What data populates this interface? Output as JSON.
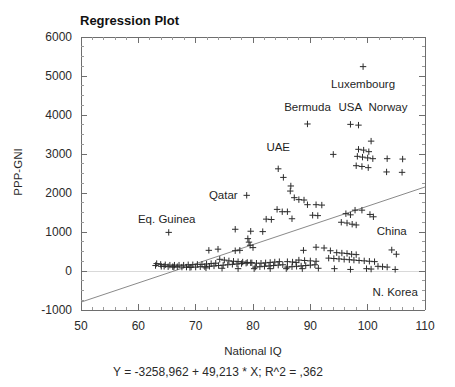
{
  "chart_data": {
    "type": "scatter",
    "title": "Regression Plot",
    "xlabel": "National IQ",
    "ylabel": "PPP-GNI",
    "xlim": [
      50,
      110
    ],
    "ylim": [
      -1000,
      6000
    ],
    "xticks": [
      50,
      60,
      70,
      80,
      90,
      100,
      110
    ],
    "yticks": [
      -1000,
      0,
      1000,
      2000,
      3000,
      4000,
      5000,
      6000
    ],
    "x_minor_step": 2,
    "y_minor_step": 250,
    "grid": false,
    "legend": "none",
    "equation_text": "Y = -3258,962 + 49,213 * X; R^2 = ,362",
    "regression": {
      "intercept": -3258.962,
      "slope": 49.213,
      "r_squared": 0.362,
      "line_from": [
        50,
        -798.3
      ],
      "line_to": [
        110,
        2154.5
      ]
    },
    "annotations": [
      {
        "label": "Luxembourg",
        "x": 99.2,
        "y": 5240,
        "anchor": "middle",
        "dx": 0,
        "dy": 21
      },
      {
        "label": "Bermuda",
        "x": 89.5,
        "y": 3880,
        "anchor": "middle",
        "dx": 0,
        "dy": -9
      },
      {
        "label": "USA",
        "x": 97.5,
        "y": 3870,
        "anchor": "middle",
        "dx": -3,
        "dy": -9
      },
      {
        "label": "Norway",
        "x": 103.2,
        "y": 3860,
        "anchor": "middle",
        "dx": 2,
        "dy": -9
      },
      {
        "label": "UAE",
        "x": 84.4,
        "y": 2850,
        "anchor": "middle",
        "dx": 0,
        "dy": -9
      },
      {
        "label": "Qatar",
        "x": 78.2,
        "y": 1960,
        "anchor": "end",
        "dx": -5,
        "dy": 4
      },
      {
        "label": "Eq. Guinea",
        "x": 65.3,
        "y": 990,
        "anchor": "middle",
        "dx": -2,
        "dy": -9
      },
      {
        "label": "China",
        "x": 104.2,
        "y": 690,
        "anchor": "middle",
        "dx": 0,
        "dy": -9
      },
      {
        "label": "N. Korea",
        "x": 104.8,
        "y": -220,
        "anchor": "middle",
        "dx": 0,
        "dy": 16
      }
    ],
    "points": [
      [
        99.2,
        5240
      ],
      [
        89.5,
        3770
      ],
      [
        97.0,
        3760
      ],
      [
        98.4,
        3740
      ],
      [
        100.6,
        3330
      ],
      [
        94.0,
        2990
      ],
      [
        98.4,
        3120
      ],
      [
        99.3,
        3100
      ],
      [
        100.2,
        3060
      ],
      [
        98.2,
        2940
      ],
      [
        99.1,
        2920
      ],
      [
        100.0,
        2900
      ],
      [
        100.9,
        2880
      ],
      [
        103.4,
        2880
      ],
      [
        106.1,
        2870
      ],
      [
        98.0,
        2700
      ],
      [
        99.0,
        2680
      ],
      [
        100.1,
        2650
      ],
      [
        103.3,
        2540
      ],
      [
        106.0,
        2530
      ],
      [
        84.4,
        2620
      ],
      [
        85.3,
        2400
      ],
      [
        86.6,
        2180
      ],
      [
        86.5,
        2050
      ],
      [
        87.2,
        1880
      ],
      [
        88.0,
        1830
      ],
      [
        88.9,
        1820
      ],
      [
        78.9,
        1940
      ],
      [
        89.5,
        1700
      ],
      [
        91.0,
        1700
      ],
      [
        92.0,
        1690
      ],
      [
        84.2,
        1580
      ],
      [
        85.1,
        1520
      ],
      [
        86.0,
        1520
      ],
      [
        82.3,
        1330
      ],
      [
        83.2,
        1320
      ],
      [
        86.8,
        1340
      ],
      [
        90.4,
        1430
      ],
      [
        91.3,
        1420
      ],
      [
        96.2,
        1470
      ],
      [
        97.0,
        1440
      ],
      [
        97.8,
        1560
      ],
      [
        99.0,
        1560
      ],
      [
        100.4,
        1450
      ],
      [
        101.0,
        1390
      ],
      [
        95.4,
        1250
      ],
      [
        96.4,
        1230
      ],
      [
        97.3,
        1200
      ],
      [
        98.0,
        1180
      ],
      [
        65.3,
        990
      ],
      [
        76.9,
        1070
      ],
      [
        79.6,
        1020
      ],
      [
        81.7,
        1010
      ],
      [
        79.1,
        830
      ],
      [
        79.3,
        740
      ],
      [
        79.5,
        660
      ],
      [
        80.0,
        600
      ],
      [
        72.3,
        530
      ],
      [
        73.9,
        560
      ],
      [
        76.9,
        520
      ],
      [
        77.7,
        530
      ],
      [
        88.8,
        530
      ],
      [
        91.0,
        610
      ],
      [
        92.4,
        590
      ],
      [
        93.5,
        520
      ],
      [
        94.6,
        470
      ],
      [
        95.5,
        460
      ],
      [
        96.4,
        450
      ],
      [
        97.2,
        430
      ],
      [
        98.0,
        420
      ],
      [
        93.2,
        330
      ],
      [
        94.1,
        320
      ],
      [
        95.0,
        310
      ],
      [
        95.9,
        300
      ],
      [
        96.8,
        290
      ],
      [
        97.6,
        280
      ],
      [
        98.5,
        270
      ],
      [
        99.4,
        260
      ],
      [
        100.3,
        250
      ],
      [
        101.2,
        240
      ],
      [
        88.0,
        280
      ],
      [
        89.0,
        270
      ],
      [
        90.0,
        260
      ],
      [
        91.0,
        250
      ],
      [
        86.0,
        240
      ],
      [
        86.9,
        230
      ],
      [
        87.5,
        220
      ],
      [
        74.2,
        300
      ],
      [
        75.0,
        280
      ],
      [
        75.8,
        260
      ],
      [
        76.6,
        250
      ],
      [
        77.4,
        240
      ],
      [
        78.2,
        230
      ],
      [
        79.0,
        220
      ],
      [
        79.8,
        210
      ],
      [
        80.6,
        200
      ],
      [
        81.4,
        200
      ],
      [
        82.2,
        210
      ],
      [
        83.0,
        220
      ],
      [
        83.8,
        230
      ],
      [
        84.6,
        240
      ],
      [
        73.5,
        200
      ],
      [
        72.7,
        190
      ],
      [
        71.9,
        180
      ],
      [
        71.1,
        170
      ],
      [
        70.3,
        170
      ],
      [
        69.5,
        160
      ],
      [
        68.7,
        160
      ],
      [
        67.9,
        150
      ],
      [
        67.1,
        150
      ],
      [
        66.3,
        150
      ],
      [
        65.5,
        150
      ],
      [
        64.7,
        160
      ],
      [
        63.9,
        170
      ],
      [
        63.2,
        190
      ],
      [
        64.5,
        120
      ],
      [
        65.2,
        110
      ],
      [
        66.0,
        110
      ],
      [
        66.8,
        110
      ],
      [
        67.6,
        100
      ],
      [
        68.4,
        100
      ],
      [
        69.2,
        100
      ],
      [
        70.0,
        100
      ],
      [
        70.8,
        110
      ],
      [
        71.6,
        110
      ],
      [
        72.4,
        120
      ],
      [
        73.2,
        130
      ],
      [
        74.0,
        140
      ],
      [
        74.8,
        150
      ],
      [
        75.6,
        160
      ],
      [
        76.4,
        170
      ],
      [
        77.2,
        180
      ],
      [
        78.0,
        190
      ],
      [
        78.8,
        200
      ],
      [
        79.6,
        210
      ],
      [
        80.4,
        100
      ],
      [
        81.2,
        110
      ],
      [
        82.0,
        120
      ],
      [
        82.8,
        130
      ],
      [
        83.6,
        140
      ],
      [
        84.4,
        150
      ],
      [
        85.2,
        160
      ],
      [
        86.0,
        100
      ],
      [
        86.8,
        110
      ],
      [
        87.6,
        120
      ],
      [
        88.4,
        130
      ],
      [
        89.2,
        140
      ],
      [
        90.0,
        150
      ],
      [
        90.8,
        160
      ],
      [
        104.2,
        540
      ],
      [
        105.0,
        430
      ],
      [
        101.8,
        120
      ],
      [
        102.6,
        110
      ],
      [
        103.4,
        100
      ],
      [
        104.8,
        40
      ],
      [
        99.8,
        60
      ],
      [
        100.6,
        50
      ],
      [
        97.0,
        40
      ],
      [
        94.2,
        60
      ],
      [
        91.4,
        70
      ],
      [
        88.6,
        60
      ],
      [
        85.8,
        60
      ],
      [
        83.0,
        60
      ],
      [
        80.2,
        60
      ],
      [
        77.4,
        60
      ],
      [
        74.6,
        70
      ],
      [
        71.8,
        80
      ],
      [
        69.0,
        90
      ],
      [
        66.2,
        100
      ],
      [
        64.0,
        120
      ],
      [
        63.0,
        140
      ]
    ]
  }
}
